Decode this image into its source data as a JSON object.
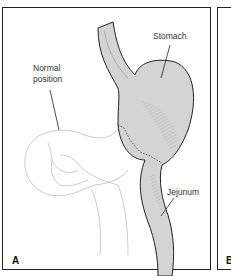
{
  "figure": {
    "panels": [
      {
        "letter": "A",
        "labels": {
          "stomach": "Stomach",
          "normal_position_line1": "Normal",
          "normal_position_line2": "position",
          "jejunum": "Jejunum"
        }
      },
      {
        "letter": "B"
      }
    ],
    "colors": {
      "organ_fill": "#d4d4d4",
      "outline": "#222222",
      "faint_outline": "#b8b8b8"
    }
  }
}
